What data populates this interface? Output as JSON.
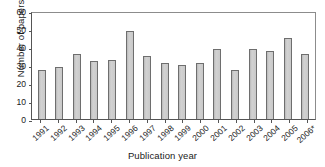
{
  "chart_data": {
    "type": "bar",
    "title": "",
    "xlabel": "Publication year",
    "ylabel": "Number of papers",
    "categories": [
      "1991",
      "1992",
      "1993",
      "1994",
      "1995",
      "1996",
      "1997",
      "1998",
      "1999",
      "2000",
      "2001",
      "2002",
      "2003",
      "2004",
      "2005",
      "2006*"
    ],
    "values": [
      27,
      29,
      36,
      32,
      33,
      49,
      35,
      31,
      30,
      31,
      39,
      27,
      39,
      38,
      45,
      36
    ],
    "ylim": [
      0,
      60
    ],
    "yticks": [
      0,
      10,
      20,
      30,
      40,
      50,
      60
    ],
    "ytick_labels": [
      "0",
      "10",
      "20",
      "30",
      "40",
      "50",
      "60"
    ],
    "grid": false,
    "legend": null,
    "bar_color": "#c6c6c6",
    "bar_edge_color": "#6e6e6e",
    "axis_color": "#555555",
    "text_color": "#1a1a1a"
  }
}
